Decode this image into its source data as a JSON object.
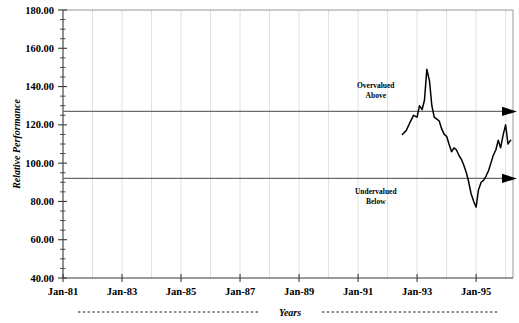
{
  "chart_data": {
    "type": "line",
    "title": "",
    "xlabel": "Years",
    "ylabel": "Relative Performance",
    "ylim": [
      40,
      180
    ],
    "ytick_values": [
      40,
      60,
      80,
      100,
      120,
      140,
      160,
      180
    ],
    "ytick_labels": [
      "40.00",
      "60.00",
      "80.00",
      "100.00",
      "120.00",
      "140.00",
      "160.00",
      "180.00"
    ],
    "ytick_step": 20,
    "yminor_step": 5,
    "xlim": [
      "Jan-81",
      "Jan-96"
    ],
    "xtick_labels": [
      "Jan-81",
      "Jan-83",
      "Jan-85",
      "Jan-87",
      "Jan-89",
      "Jan-91",
      "Jan-93",
      "Jan-95"
    ],
    "xtick_years": [
      1981,
      1983,
      1985,
      1987,
      1989,
      1991,
      1993,
      1995
    ],
    "grid": "vertical gridlines at each year, light gray",
    "legend": "none",
    "reference_lines": [
      {
        "name": "overvalued-threshold",
        "value": 127,
        "style": "solid gray with right arrowhead"
      },
      {
        "name": "undervalued-threshold",
        "value": 92,
        "style": "solid gray with right arrowhead"
      }
    ],
    "annotations": [
      {
        "name": "overvalued-note",
        "line1": "Overvalued",
        "line2": "Above",
        "x_year": 1991.6,
        "y": 139
      },
      {
        "name": "undervalued-note",
        "line1": "Undervalued",
        "line2": "Below",
        "x_year": 1991.6,
        "y": 84
      }
    ],
    "series": [
      {
        "name": "Relative Performance",
        "color": "#000000",
        "x": [
          1992.5,
          1992.63,
          1992.75,
          1992.88,
          1993.0,
          1993.08,
          1993.17,
          1993.25,
          1993.33,
          1993.42,
          1993.5,
          1993.58,
          1993.67,
          1993.75,
          1993.83,
          1993.92,
          1994.0,
          1994.08,
          1994.17,
          1994.25,
          1994.33,
          1994.42,
          1994.5,
          1994.58,
          1994.67,
          1994.75,
          1994.83,
          1994.92,
          1995.0,
          1995.08,
          1995.17,
          1995.25,
          1995.33,
          1995.42,
          1995.5,
          1995.58,
          1995.67,
          1995.75,
          1995.83,
          1995.92,
          1996.0,
          1996.08,
          1996.17
        ],
        "y": [
          115,
          117,
          121,
          125,
          124,
          130,
          128,
          133,
          149,
          143,
          130,
          124,
          123,
          122,
          118,
          115,
          114,
          110,
          106,
          108,
          107,
          104,
          102,
          99,
          95,
          90,
          84,
          80,
          77,
          86,
          90,
          91,
          93,
          96,
          100,
          104,
          107,
          112,
          108,
          115,
          120,
          110,
          112
        ]
      }
    ],
    "data_window": {
      "first_point_year": 1992.5,
      "last_point_year": 1996.17,
      "min_y": 77,
      "max_y": 149
    }
  },
  "axis": {
    "y_title": "Relative Performance",
    "x_caption": "Years"
  }
}
